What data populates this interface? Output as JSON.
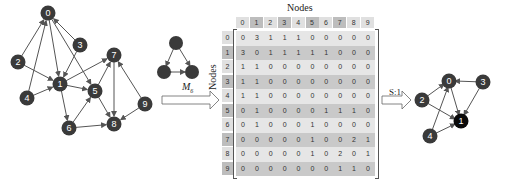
{
  "diagram": {
    "left_graph": {
      "nodes": [
        {
          "id": "0",
          "x": 48,
          "y": 13
        },
        {
          "id": "1",
          "x": 60,
          "y": 84
        },
        {
          "id": "2",
          "x": 18,
          "y": 62
        },
        {
          "id": "3",
          "x": 80,
          "y": 45
        },
        {
          "id": "4",
          "x": 27,
          "y": 98
        },
        {
          "id": "5",
          "x": 95,
          "y": 91
        },
        {
          "id": "6",
          "x": 69,
          "y": 128
        },
        {
          "id": "7",
          "x": 114,
          "y": 55
        },
        {
          "id": "8",
          "x": 114,
          "y": 124
        },
        {
          "id": "9",
          "x": 145,
          "y": 104
        }
      ],
      "edges": [
        [
          "2",
          "0"
        ],
        [
          "3",
          "0"
        ],
        [
          "0",
          "1"
        ],
        [
          "0",
          "5"
        ],
        [
          "4",
          "0"
        ],
        [
          "2",
          "1"
        ],
        [
          "4",
          "1"
        ],
        [
          "3",
          "1"
        ],
        [
          "1",
          "7"
        ],
        [
          "1",
          "5"
        ],
        [
          "1",
          "6"
        ],
        [
          "6",
          "5"
        ],
        [
          "5",
          "7"
        ],
        [
          "5",
          "8"
        ],
        [
          "6",
          "8"
        ],
        [
          "7",
          "8"
        ],
        [
          "9",
          "7"
        ],
        [
          "9",
          "8"
        ]
      ]
    },
    "motif": {
      "label_main": "M",
      "label_sub": "6",
      "nodes": [
        {
          "x": 176,
          "y": 43
        },
        {
          "x": 164,
          "y": 72
        },
        {
          "x": 192,
          "y": 72
        }
      ]
    },
    "matrix": {
      "title": "Nodes",
      "ylabel": "Nodes",
      "headers": [
        "0",
        "1",
        "2",
        "3",
        "4",
        "5",
        "6",
        "7",
        "8",
        "9"
      ],
      "rows": [
        [
          "0",
          "3",
          "1",
          "1",
          "1",
          "0",
          "0",
          "0",
          "0",
          "0"
        ],
        [
          "3",
          "0",
          "1",
          "1",
          "1",
          "1",
          "1",
          "0",
          "0",
          "0"
        ],
        [
          "1",
          "1",
          "0",
          "0",
          "0",
          "0",
          "0",
          "0",
          "0",
          "0"
        ],
        [
          "1",
          "1",
          "0",
          "0",
          "0",
          "0",
          "0",
          "0",
          "0",
          "0"
        ],
        [
          "1",
          "1",
          "0",
          "0",
          "0",
          "0",
          "0",
          "0",
          "0",
          "0"
        ],
        [
          "0",
          "1",
          "0",
          "0",
          "0",
          "0",
          "1",
          "1",
          "1",
          "0"
        ],
        [
          "0",
          "1",
          "0",
          "0",
          "0",
          "1",
          "0",
          "0",
          "0",
          "0"
        ],
        [
          "0",
          "0",
          "0",
          "0",
          "0",
          "1",
          "0",
          "0",
          "2",
          "1"
        ],
        [
          "0",
          "0",
          "0",
          "0",
          "0",
          "1",
          "0",
          "2",
          "0",
          "1"
        ],
        [
          "0",
          "0",
          "0",
          "0",
          "0",
          "0",
          "0",
          "1",
          "1",
          "0"
        ]
      ]
    },
    "step_label": "S:1",
    "right_graph": {
      "nodes": [
        {
          "id": "0",
          "x": 449,
          "y": 81,
          "highlight": false
        },
        {
          "id": "1",
          "x": 461,
          "y": 121,
          "highlight": true
        },
        {
          "id": "2",
          "x": 422,
          "y": 100,
          "highlight": false
        },
        {
          "id": "3",
          "x": 483,
          "y": 82,
          "highlight": false
        },
        {
          "id": "4",
          "x": 430,
          "y": 136,
          "highlight": false
        }
      ]
    },
    "colors": {
      "node": "#3a3a3a",
      "node_highlight": "#0a0a0a",
      "row_light": "#e6e6e6",
      "row_dark": "#c9c9c9",
      "header_light": "#e0e0e0",
      "header_dark": "#bdbdbd"
    }
  }
}
